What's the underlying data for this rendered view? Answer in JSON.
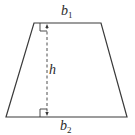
{
  "diagram": {
    "type": "trapezoid",
    "colors": {
      "stroke": "#3a3a3a",
      "background": "#ffffff"
    },
    "labels": {
      "top_base": {
        "main": "b",
        "sub": "1"
      },
      "bottom_base": {
        "main": "b",
        "sub": "2"
      },
      "height": {
        "main": "h"
      }
    },
    "shape": {
      "top_left": [
        34,
        23
      ],
      "top_right": [
        101,
        23
      ],
      "bottom_right": [
        127,
        117
      ],
      "bottom_left": [
        6,
        117
      ]
    },
    "height_line": {
      "x": 47,
      "y1": 23,
      "y2": 117,
      "style": "dashed",
      "arrows": "both"
    },
    "right_angle_marks": [
      "top",
      "bottom"
    ]
  }
}
